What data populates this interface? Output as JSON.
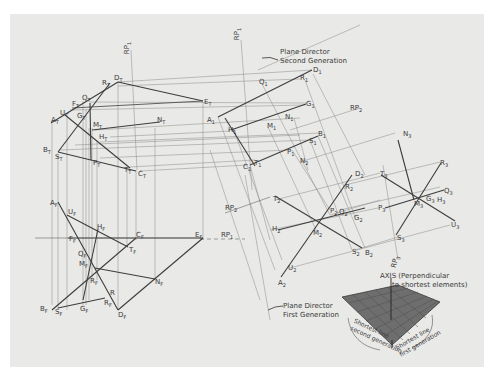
{
  "figure": {
    "background_color": "#e9e9e7",
    "line_color": "#4a4a4a",
    "thin_line_color": "#777777"
  },
  "annotations": {
    "plane_director_second": [
      "Plane Director",
      "Second Generation"
    ],
    "plane_director_first": [
      "Plane Director",
      "First Generation"
    ],
    "axis": [
      "AXIS (Perpendicular",
      "to shortest elements)"
    ],
    "shortest_second": [
      "Shortest line",
      "second generation"
    ],
    "shortest_first": [
      "Shortest line",
      "first generation"
    ]
  },
  "reference_planes": [
    {
      "base": "RP",
      "sub": "1",
      "id": "rp1-top-left"
    },
    {
      "base": "RP",
      "sub": "1",
      "id": "rp1-top"
    },
    {
      "base": "RP",
      "sub": "2",
      "id": "rp2-right"
    },
    {
      "base": "RP",
      "sub": "1",
      "id": "rp1-front"
    },
    {
      "base": "RP",
      "sub": "2",
      "id": "rp2-left"
    },
    {
      "base": "RP",
      "sub": "3",
      "id": "rp3-bottom"
    }
  ],
  "labels": {
    "top_view": [
      {
        "base": "D",
        "sub": "T",
        "x": 114,
        "y": 75
      },
      {
        "base": "R",
        "sub": "T",
        "x": 102,
        "y": 80
      },
      {
        "base": "Q",
        "sub": "T",
        "x": 82,
        "y": 95
      },
      {
        "base": "F",
        "sub": "T",
        "x": 72,
        "y": 101
      },
      {
        "base": "U",
        "sub": "T",
        "x": 60,
        "y": 110
      },
      {
        "base": "G",
        "sub": "T",
        "x": 77,
        "y": 113
      },
      {
        "base": "A",
        "sub": "T",
        "x": 51,
        "y": 117
      },
      {
        "base": "M",
        "sub": "T",
        "x": 93,
        "y": 122
      },
      {
        "base": "N",
        "sub": "T",
        "x": 157,
        "y": 117
      },
      {
        "base": "E",
        "sub": "T",
        "x": 204,
        "y": 99
      },
      {
        "base": "H",
        "sub": "T",
        "x": 99,
        "y": 134
      },
      {
        "base": "B",
        "sub": "T",
        "x": 43,
        "y": 147
      },
      {
        "base": "S",
        "sub": "T",
        "x": 55,
        "y": 154
      },
      {
        "base": "P",
        "sub": "T",
        "x": 93,
        "y": 160
      },
      {
        "base": "T",
        "sub": "T",
        "x": 124,
        "y": 167
      },
      {
        "base": "C",
        "sub": "T",
        "x": 138,
        "y": 171
      }
    ],
    "front_view": [
      {
        "base": "A",
        "sub": "F",
        "x": 50,
        "y": 200
      },
      {
        "base": "U",
        "sub": "F",
        "x": 68,
        "y": 209
      },
      {
        "base": "H",
        "sub": "F",
        "x": 97,
        "y": 224
      },
      {
        "base": "F",
        "sub": "F",
        "x": 69,
        "y": 236
      },
      {
        "base": "C",
        "sub": "F",
        "x": 136,
        "y": 232
      },
      {
        "base": "E",
        "sub": "F",
        "x": 195,
        "y": 232
      },
      {
        "base": "T",
        "sub": "F",
        "x": 129,
        "y": 247
      },
      {
        "base": "Q",
        "sub": "F",
        "x": 78,
        "y": 251
      },
      {
        "base": "M",
        "sub": "F",
        "x": 79,
        "y": 261
      },
      {
        "base": "R",
        "sub": "F",
        "x": 90,
        "y": 278
      },
      {
        "base": "N",
        "sub": "F",
        "x": 155,
        "y": 279
      },
      {
        "base": "R",
        "sub": "",
        "x": 110,
        "y": 290
      },
      {
        "base": "R",
        "sub": "F",
        "x": 104,
        "y": 300
      },
      {
        "base": "B",
        "sub": "F",
        "x": 40,
        "y": 306
      },
      {
        "base": "S",
        "sub": "F",
        "x": 55,
        "y": 309
      },
      {
        "base": "G",
        "sub": "F",
        "x": 80,
        "y": 306
      },
      {
        "base": "D",
        "sub": "F",
        "x": 118,
        "y": 312
      }
    ],
    "aux_view_1": [
      {
        "base": "D",
        "sub": "1",
        "x": 313,
        "y": 67
      },
      {
        "base": "Q",
        "sub": "1",
        "x": 259,
        "y": 79
      },
      {
        "base": "R",
        "sub": "1",
        "x": 300,
        "y": 75
      },
      {
        "base": "A",
        "sub": "1",
        "x": 207,
        "y": 117
      },
      {
        "base": "G",
        "sub": "1",
        "x": 306,
        "y": 101
      },
      {
        "base": "N",
        "sub": "1",
        "x": 285,
        "y": 114
      },
      {
        "base": "M",
        "sub": "1",
        "x": 267,
        "y": 123
      },
      {
        "base": "H",
        "sub": "1",
        "x": 228,
        "y": 127
      },
      {
        "base": "B",
        "sub": "1",
        "x": 318,
        "y": 131
      },
      {
        "base": "S",
        "sub": "1",
        "x": 309,
        "y": 138
      },
      {
        "base": "P",
        "sub": "1",
        "x": 287,
        "y": 149
      },
      {
        "base": "N",
        "sub": "2",
        "x": 300,
        "y": 158
      },
      {
        "base": "C",
        "sub": "1",
        "x": 243,
        "y": 164
      },
      {
        "base": "T",
        "sub": "1",
        "x": 254,
        "y": 160
      }
    ],
    "aux_view_2": [
      {
        "base": "D",
        "sub": "2",
        "x": 355,
        "y": 171
      },
      {
        "base": "R",
        "sub": "2",
        "x": 345,
        "y": 184
      },
      {
        "base": "T",
        "sub": "2",
        "x": 273,
        "y": 196
      },
      {
        "base": "P",
        "sub": "2",
        "x": 330,
        "y": 208
      },
      {
        "base": "Q",
        "sub": "2",
        "x": 339,
        "y": 209
      },
      {
        "base": "G",
        "sub": "2",
        "x": 354,
        "y": 215
      },
      {
        "base": "H",
        "sub": "2",
        "x": 272,
        "y": 226
      },
      {
        "base": "M",
        "sub": "2",
        "x": 313,
        "y": 230
      },
      {
        "base": "S",
        "sub": "2",
        "x": 352,
        "y": 249
      },
      {
        "base": "B",
        "sub": "2",
        "x": 365,
        "y": 250
      },
      {
        "base": "U",
        "sub": "2",
        "x": 288,
        "y": 265
      },
      {
        "base": "A",
        "sub": "2",
        "x": 278,
        "y": 280
      }
    ],
    "aux_view_3": [
      {
        "base": "N",
        "sub": "3",
        "x": 403,
        "y": 131
      },
      {
        "base": "R",
        "sub": "3",
        "x": 440,
        "y": 160
      },
      {
        "base": "T",
        "sub": "3",
        "x": 380,
        "y": 171
      },
      {
        "base": "Q",
        "sub": "3",
        "x": 444,
        "y": 188
      },
      {
        "base": "P",
        "sub": "3",
        "x": 378,
        "y": 205
      },
      {
        "base": "G",
        "sub": "3",
        "x": 426,
        "y": 196
      },
      {
        "base": "H",
        "sub": "3",
        "x": 437,
        "y": 197
      },
      {
        "base": "M",
        "sub": "3",
        "x": 414,
        "y": 201
      },
      {
        "base": "U",
        "sub": "3",
        "x": 451,
        "y": 222
      },
      {
        "base": "S",
        "sub": "3",
        "x": 397,
        "y": 235
      }
    ]
  }
}
